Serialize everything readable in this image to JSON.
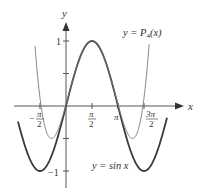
{
  "chart_data": {
    "type": "line",
    "title": "",
    "xlabel": "x",
    "ylabel": "y",
    "grid": false,
    "legend_position": "inline labels",
    "xlim": [
      -3.9,
      6.05
    ],
    "ylim": [
      -1.2,
      1.6
    ],
    "x_ticks": [
      {
        "value": -1.5708,
        "label_num": "π",
        "label_den": "2",
        "sign": "−"
      },
      {
        "value": 1.5708,
        "label_num": "π",
        "label_den": "2",
        "sign": ""
      },
      {
        "value": 3.1416,
        "label": "π"
      },
      {
        "value": 4.7124,
        "label_num": "3π",
        "label_den": "2",
        "sign": ""
      }
    ],
    "y_ticks": [
      {
        "value": 1,
        "label": "1"
      },
      {
        "value": 0.5,
        "label": ""
      },
      {
        "value": -0.5,
        "label": ""
      },
      {
        "value": -1,
        "label": "−1"
      }
    ],
    "series": [
      {
        "name": "y = sin x",
        "style": "thick dark",
        "color": "#3a3a3a",
        "function": "sin(x)",
        "x_range": [
          -2.9,
          6.1
        ],
        "points": [
          [
            -2.9,
            -0.239
          ],
          [
            -1.5708,
            -1
          ],
          [
            0,
            0
          ],
          [
            1.5708,
            1
          ],
          [
            3.1416,
            0
          ],
          [
            4.7124,
            -1
          ],
          [
            6.1,
            -0.182
          ]
        ]
      },
      {
        "name": "y = P4(x)",
        "style": "thin gray",
        "color": "#7a7a7a",
        "function": "1 - (x - π/2)^2/2 + (x - π/2)^4/24",
        "x_range": [
          -1.87,
          5.02
        ],
        "points": [
          [
            -1.87,
            0.98
          ],
          [
            -1.5708,
            0.12
          ],
          [
            -0.879,
            -0.5
          ],
          [
            0,
            0.0199
          ],
          [
            1.5708,
            1
          ],
          [
            3.1416,
            0.0199
          ],
          [
            4.02,
            -0.5
          ],
          [
            4.7124,
            0.12
          ],
          [
            5.02,
            0.98
          ]
        ]
      }
    ],
    "annotations": [
      {
        "text": "y = P4(x)",
        "near": "upper right"
      },
      {
        "text": "y = sin x",
        "near": "lower center"
      }
    ]
  },
  "labels": {
    "y_axis": "y",
    "x_axis": "x",
    "p4_prefix": "y = ",
    "p4_P": "P",
    "p4_sub": "4",
    "p4_arg": "(x)",
    "sin_label": "y = sin x",
    "y_one": "1",
    "y_minus_one": "−1",
    "neg": "−",
    "pi": "π",
    "three_pi": "3π",
    "two": "2"
  },
  "colors": {
    "axis": "#555555",
    "sin": "#3a3a3a",
    "p4": "#7a7a7a",
    "text": "#333333"
  }
}
